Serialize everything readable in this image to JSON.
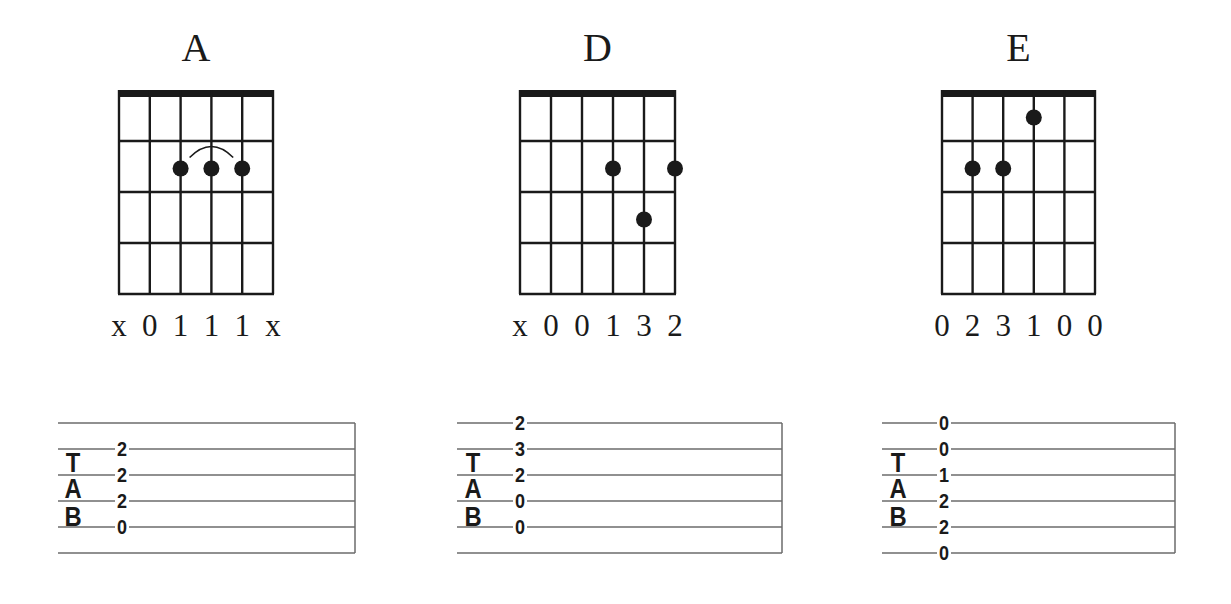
{
  "layout": {
    "grid_top": 90,
    "nut_height": 7,
    "grid_bottom": 294,
    "fret_count": 4,
    "string_count": 6,
    "dot_radius": 8,
    "title_baseline": 61,
    "finger_baseline": 336,
    "staff_top": 423,
    "staff_spacing": 26,
    "staff_line_count": 6,
    "colors": {
      "ink": "#1a1a1a",
      "staff_line": "#6b6b6b",
      "background": "#ffffff"
    }
  },
  "tab_clef": [
    "T",
    "A",
    "B"
  ],
  "chords": [
    {
      "name": "A",
      "grid_left": 119,
      "grid_right": 273,
      "fingers": [
        "x",
        "0",
        "1",
        "1",
        "1",
        "x"
      ],
      "dots": [
        {
          "string": 3,
          "fret": 2
        },
        {
          "string": 4,
          "fret": 2
        },
        {
          "string": 5,
          "fret": 2
        }
      ],
      "barre_arc": {
        "from_string": 3,
        "to_string": 5,
        "fret": 2
      },
      "staff": {
        "left": 58,
        "right": 355,
        "clef_x": 73,
        "notes_x": 122,
        "notes": [
          {
            "line": 2,
            "value": "2"
          },
          {
            "line": 3,
            "value": "2"
          },
          {
            "line": 4,
            "value": "2"
          },
          {
            "line": 5,
            "value": "0"
          }
        ]
      }
    },
    {
      "name": "D",
      "grid_left": 520,
      "grid_right": 675,
      "fingers": [
        "x",
        "0",
        "0",
        "1",
        "3",
        "2"
      ],
      "dots": [
        {
          "string": 4,
          "fret": 2
        },
        {
          "string": 6,
          "fret": 2
        },
        {
          "string": 5,
          "fret": 3
        }
      ],
      "barre_arc": null,
      "staff": {
        "left": 457,
        "right": 782,
        "clef_x": 473,
        "notes_x": 520,
        "notes": [
          {
            "line": 1,
            "value": "2"
          },
          {
            "line": 2,
            "value": "3"
          },
          {
            "line": 3,
            "value": "2"
          },
          {
            "line": 4,
            "value": "0"
          },
          {
            "line": 5,
            "value": "0"
          }
        ]
      }
    },
    {
      "name": "E",
      "grid_left": 942,
      "grid_right": 1095,
      "fingers": [
        "0",
        "2",
        "3",
        "1",
        "0",
        "0"
      ],
      "dots": [
        {
          "string": 4,
          "fret": 1
        },
        {
          "string": 2,
          "fret": 2
        },
        {
          "string": 3,
          "fret": 2
        }
      ],
      "barre_arc": null,
      "staff": {
        "left": 882,
        "right": 1175,
        "clef_x": 898,
        "notes_x": 944,
        "notes": [
          {
            "line": 1,
            "value": "0"
          },
          {
            "line": 2,
            "value": "0"
          },
          {
            "line": 3,
            "value": "1"
          },
          {
            "line": 4,
            "value": "2"
          },
          {
            "line": 5,
            "value": "2"
          },
          {
            "line": 6,
            "value": "0"
          }
        ]
      }
    }
  ]
}
